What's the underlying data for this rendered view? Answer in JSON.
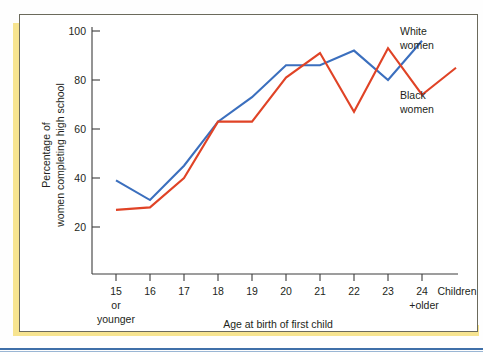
{
  "figure": {
    "accent_color": "#f7e490",
    "frame_color": "#6b6a5c",
    "rule_color": "#3f6fa8"
  },
  "chart_data": {
    "type": "line",
    "title": "",
    "xlabel": "Age at birth of first child",
    "ylabel": "Percentage of women completing high school",
    "ylabel_line1": "Percentage of",
    "ylabel_line2": "women completing high school",
    "ylim": [
      0,
      100
    ],
    "yticks": [
      20,
      40,
      60,
      80,
      100
    ],
    "ytick_labels": [
      "20",
      "40",
      "60",
      "80",
      "100"
    ],
    "grid": false,
    "legend_position": "right-inline",
    "categories": [
      "15",
      "16",
      "17",
      "18",
      "19",
      "20",
      "21",
      "22",
      "23",
      "24",
      "Children"
    ],
    "xtick_labels": [
      "15",
      "16",
      "17",
      "18",
      "19",
      "20",
      "21",
      "22",
      "23",
      "24",
      "Children"
    ],
    "xtick_sublabels": [
      "or younger",
      "",
      "",
      "",
      "",
      "",
      "",
      "",
      "",
      "+older",
      ""
    ],
    "xtick_sub_15_line1": "or",
    "xtick_sub_15_line2": "younger",
    "xtick_sub_24": "+older",
    "series": [
      {
        "name": "White women",
        "label_line1": "White",
        "label_line2": "women",
        "color": "#3b6fbe",
        "x": [
          "15",
          "16",
          "17",
          "18",
          "19",
          "20",
          "21",
          "22",
          "23",
          "24"
        ],
        "values": [
          39,
          31,
          45,
          63,
          73,
          86,
          86,
          92,
          80,
          96
        ]
      },
      {
        "name": "Black women",
        "label_line1": "Black",
        "label_line2": "women",
        "color": "#e04326",
        "x": [
          "15",
          "16",
          "17",
          "18",
          "19",
          "20",
          "21",
          "22",
          "23",
          "24",
          "Children"
        ],
        "values": [
          27,
          28,
          40,
          63,
          63,
          81,
          91,
          67,
          93,
          74,
          85
        ]
      }
    ]
  }
}
